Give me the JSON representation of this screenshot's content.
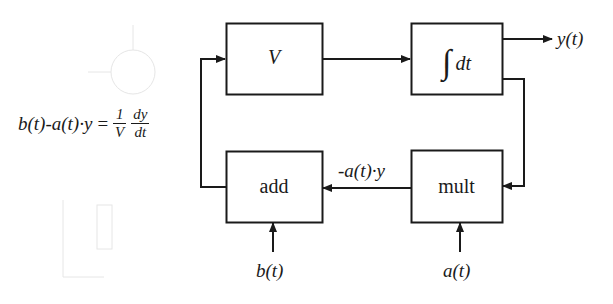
{
  "diagram": {
    "title": "",
    "equation": {
      "lhs": "b(t)-a(t)·y",
      "equals": "=",
      "frac1": {
        "num": "1",
        "den": "V"
      },
      "frac2": {
        "num": "dy",
        "den": "dt"
      }
    },
    "blocks": [
      {
        "id": "volume",
        "label": "V",
        "style": "italic"
      },
      {
        "id": "integrator",
        "symbol": "∫",
        "label": "dt",
        "style": "italic"
      },
      {
        "id": "add",
        "label": "add",
        "style": "normal"
      },
      {
        "id": "mult",
        "label": "mult",
        "style": "normal"
      }
    ],
    "signals": {
      "output": "y(t)",
      "feedback": "-a(t)·y",
      "input_b": "b(t)",
      "input_a": "a(t)"
    },
    "edges": [
      {
        "from": "add",
        "to": "volume"
      },
      {
        "from": "volume",
        "to": "integrator"
      },
      {
        "from": "integrator",
        "to": "output",
        "label": "y(t)"
      },
      {
        "from": "integrator",
        "to": "mult"
      },
      {
        "from": "mult",
        "to": "add",
        "label": "-a(t)·y"
      },
      {
        "from": "input_b",
        "to": "add",
        "label": "b(t)"
      },
      {
        "from": "input_a",
        "to": "mult",
        "label": "a(t)"
      }
    ],
    "colors": {
      "line": "#1a1a1a",
      "background": "#ffffff"
    }
  }
}
